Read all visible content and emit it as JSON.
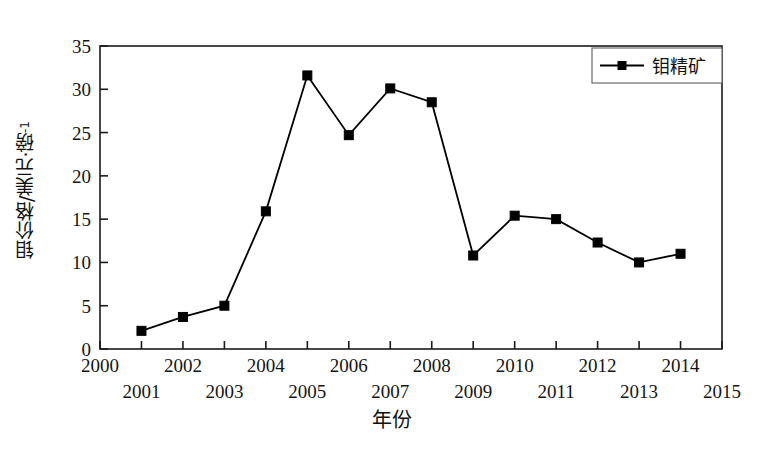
{
  "chart_data": {
    "type": "line",
    "title": "",
    "xlabel": "年份",
    "ylabel": "钼价格/美元·磅-1",
    "ylabel_main": "钼价格/美元·磅",
    "ylabel_exponent": "-1",
    "xlim": [
      2000,
      2015
    ],
    "ylim": [
      0,
      35
    ],
    "xticks": [
      2000,
      2001,
      2002,
      2003,
      2004,
      2005,
      2006,
      2007,
      2008,
      2009,
      2010,
      2011,
      2012,
      2013,
      2014,
      2015
    ],
    "xtick_labels": [
      "2000",
      "2001",
      "2002",
      "2003",
      "2004",
      "2005",
      "2006",
      "2007",
      "2008",
      "2009",
      "2010",
      "2011",
      "2012",
      "2013",
      "2014",
      "2015"
    ],
    "yticks": [
      0,
      5,
      10,
      15,
      20,
      25,
      30,
      35
    ],
    "ytick_labels": [
      "0",
      "5",
      "10",
      "15",
      "20",
      "25",
      "30",
      "35"
    ],
    "grid": false,
    "legend_position": "top-right",
    "series": [
      {
        "name": "钼精矿",
        "marker": "square",
        "color": "#000000",
        "x": [
          2001,
          2002,
          2003,
          2004,
          2005,
          2006,
          2007,
          2008,
          2009,
          2010,
          2011,
          2012,
          2013,
          2014
        ],
        "values": [
          2.1,
          3.7,
          5.0,
          15.9,
          31.6,
          24.7,
          30.1,
          28.5,
          10.8,
          15.4,
          15.0,
          12.3,
          10.0,
          11.0
        ]
      }
    ]
  },
  "legend": {
    "entries": [
      {
        "label": "钼精矿"
      }
    ]
  },
  "axes": {
    "y_title": "钼价格/美元·磅",
    "y_title_sup": "-1",
    "x_title": "年份"
  }
}
